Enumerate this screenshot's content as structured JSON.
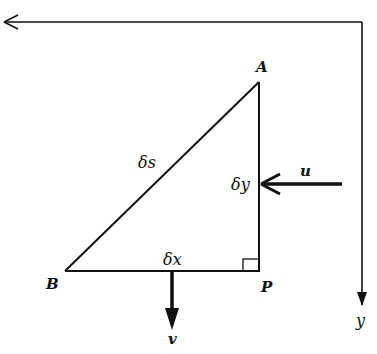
{
  "diagram": {
    "colors": {
      "stroke": "#111111",
      "background": "#ffffff"
    },
    "axes": {
      "x_axis": {
        "direction": "left",
        "label": ""
      },
      "y_axis": {
        "direction": "down",
        "label": "y"
      }
    },
    "triangle": {
      "vertices": {
        "A": "A",
        "B": "B",
        "P": "P"
      },
      "sides": {
        "hypotenuse": "δs",
        "vertical": "δy",
        "horizontal": "δx"
      },
      "right_angle_at": "P"
    },
    "velocities": {
      "u": "u",
      "v": "v"
    }
  }
}
